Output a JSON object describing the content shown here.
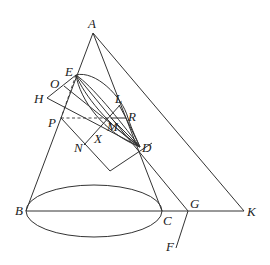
{
  "figure": {
    "type": "geometric-diagram",
    "colors": {
      "line": "#333333",
      "label": "#222222",
      "background": "#ffffff"
    },
    "points": {
      "A": {
        "label": "A",
        "x": 93,
        "y": 33
      },
      "E": {
        "label": "E",
        "x": 76,
        "y": 75
      },
      "O": {
        "label": "O",
        "x": 63,
        "y": 86
      },
      "H": {
        "label": "H",
        "x": 47,
        "y": 98
      },
      "L": {
        "label": "L",
        "x": 119,
        "y": 105
      },
      "R": {
        "label": "R",
        "x": 126,
        "y": 118
      },
      "P": {
        "label": "P",
        "x": 61,
        "y": 118
      },
      "M": {
        "label": "M",
        "x": 111,
        "y": 118
      },
      "X": {
        "label": "X",
        "x": 100,
        "y": 133
      },
      "N": {
        "label": "N",
        "x": 84,
        "y": 145
      },
      "D": {
        "label": "D",
        "x": 140,
        "y": 147
      },
      "B": {
        "label": "B",
        "x": 26,
        "y": 211
      },
      "C": {
        "label": "C",
        "x": 162,
        "y": 211
      },
      "G": {
        "label": "G",
        "x": 188,
        "y": 211
      },
      "K": {
        "label": "K",
        "x": 244,
        "y": 211
      },
      "F": {
        "label": "F",
        "x": 176,
        "y": 248
      }
    },
    "labels": [
      "A",
      "E",
      "O",
      "H",
      "L",
      "R",
      "P",
      "M",
      "X",
      "N",
      "D",
      "B",
      "C",
      "G",
      "K",
      "F"
    ]
  }
}
